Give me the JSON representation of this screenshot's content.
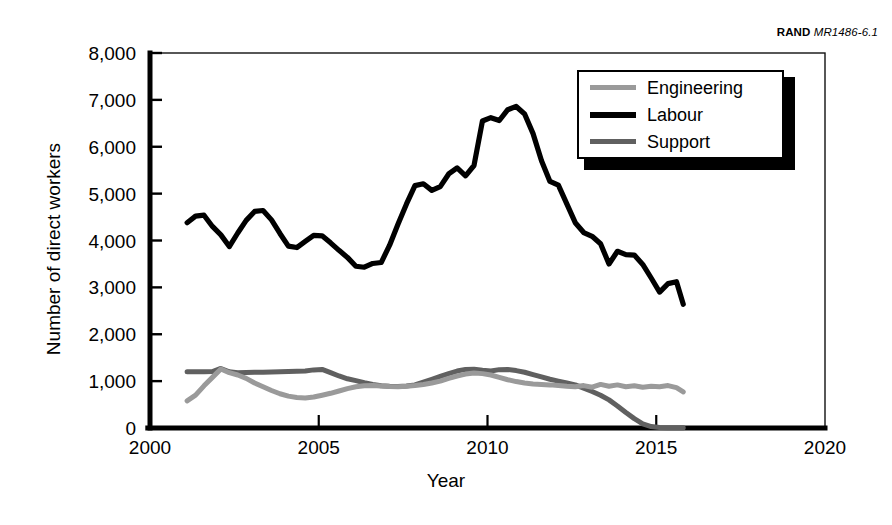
{
  "credit": {
    "org": "RAND",
    "report": "MR1486-6.1"
  },
  "chart_data": {
    "type": "line",
    "title": "",
    "xlabel": "Year",
    "ylabel": "Number of direct workers",
    "xlim": [
      2000,
      2020
    ],
    "ylim": [
      0,
      8000
    ],
    "xticks": [
      "2000",
      "2005",
      "2010",
      "2015",
      "2020"
    ],
    "xtick_values": [
      2000,
      2005,
      2010,
      2015,
      2020
    ],
    "yticks": [
      "0",
      "1,000",
      "2,000",
      "3,000",
      "4,000",
      "5,000",
      "6,000",
      "7,000",
      "8,000"
    ],
    "ytick_values": [
      0,
      1000,
      2000,
      3000,
      4000,
      5000,
      6000,
      7000,
      8000
    ],
    "grid": false,
    "legend_position": "top-right",
    "colors": {
      "engineering": "#9a9a9a",
      "labour": "#000000",
      "support": "#606060"
    },
    "x": [
      2001.1,
      2001.35,
      2001.6,
      2001.85,
      2002.1,
      2002.35,
      2002.6,
      2002.85,
      2003.1,
      2003.35,
      2003.6,
      2003.85,
      2004.1,
      2004.35,
      2004.6,
      2004.85,
      2005.1,
      2005.35,
      2005.6,
      2005.85,
      2006.1,
      2006.35,
      2006.6,
      2006.85,
      2007.1,
      2007.35,
      2007.6,
      2007.85,
      2008.1,
      2008.35,
      2008.6,
      2008.85,
      2009.1,
      2009.35,
      2009.6,
      2009.85,
      2010.1,
      2010.35,
      2010.6,
      2010.85,
      2011.1,
      2011.35,
      2011.6,
      2011.85,
      2012.1,
      2012.35,
      2012.6,
      2012.85,
      2013.1,
      2013.35,
      2013.6,
      2013.85,
      2014.1,
      2014.35,
      2014.6,
      2014.85,
      2015.1,
      2015.35,
      2015.6,
      2015.8
    ],
    "series": [
      {
        "name": "Engineering",
        "color": "#9a9a9a",
        "values": [
          580,
          700,
          900,
          1080,
          1260,
          1180,
          1130,
          1060,
          960,
          880,
          800,
          730,
          680,
          650,
          640,
          660,
          700,
          740,
          790,
          840,
          880,
          900,
          905,
          895,
          885,
          880,
          890,
          905,
          930,
          960,
          1000,
          1060,
          1110,
          1150,
          1175,
          1160,
          1130,
          1080,
          1030,
          990,
          960,
          940,
          930,
          920,
          905,
          890,
          880,
          905,
          870,
          930,
          890,
          920,
          880,
          900,
          870,
          890,
          880,
          905,
          860,
          770
        ]
      },
      {
        "name": "Labour",
        "color": "#000000",
        "values": [
          4380,
          4520,
          4540,
          4300,
          4120,
          3870,
          4160,
          4430,
          4620,
          4640,
          4440,
          4150,
          3880,
          3850,
          3980,
          4110,
          4100,
          3950,
          3790,
          3640,
          3450,
          3430,
          3510,
          3530,
          3900,
          4350,
          4780,
          5170,
          5210,
          5070,
          5150,
          5420,
          5550,
          5380,
          5600,
          6550,
          6620,
          6560,
          6790,
          6860,
          6700,
          6280,
          5700,
          5260,
          5180,
          4780,
          4380,
          4170,
          4090,
          3930,
          3500,
          3770,
          3700,
          3690,
          3490,
          3200,
          2900,
          3080,
          3120,
          2640
        ]
      },
      {
        "name": "Support",
        "color": "#606060",
        "values": [
          1200,
          1200,
          1200,
          1205,
          1270,
          1200,
          1180,
          1185,
          1190,
          1190,
          1195,
          1200,
          1205,
          1210,
          1215,
          1240,
          1250,
          1180,
          1110,
          1050,
          1010,
          965,
          930,
          900,
          890,
          885,
          895,
          920,
          980,
          1040,
          1100,
          1160,
          1215,
          1250,
          1255,
          1230,
          1215,
          1245,
          1250,
          1225,
          1190,
          1140,
          1090,
          1040,
          1000,
          960,
          920,
          850,
          780,
          700,
          600,
          470,
          330,
          200,
          90,
          30,
          10,
          5,
          5,
          5
        ]
      }
    ]
  },
  "legend": {
    "items": [
      {
        "label": "Engineering",
        "color": "#9a9a9a",
        "weight": 5
      },
      {
        "label": "Labour",
        "color": "#000000",
        "weight": 6
      },
      {
        "label": "Support",
        "color": "#606060",
        "weight": 5
      }
    ]
  }
}
